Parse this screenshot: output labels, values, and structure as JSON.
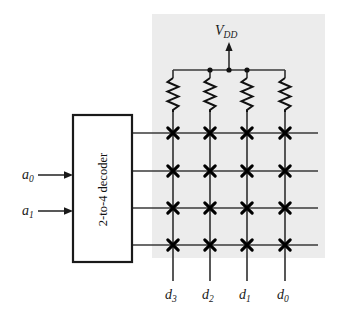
{
  "figure": {
    "background_color": "#ffffff",
    "shaded_region_color": "#ececec",
    "line_color": "#3a3a3a",
    "marker_color": "#000000",
    "text_color": "#1a1a1a"
  },
  "decoder": {
    "label": "2-to-4 decoder",
    "box": {
      "x": 73,
      "y": 115,
      "width": 59,
      "height": 147
    },
    "inputs": [
      {
        "name": "a0",
        "base": "a",
        "subscript": "0",
        "y": 175
      },
      {
        "name": "a1",
        "base": "a",
        "subscript": "1",
        "y": 211
      }
    ],
    "output_count": 4
  },
  "power": {
    "label_base": "V",
    "label_subscript": "DD",
    "rail_y": 70,
    "arrow_x": 229,
    "junction_dots": [
      210,
      229,
      247
    ]
  },
  "array": {
    "columns": [
      {
        "name": "d3",
        "base": "d",
        "subscript": "3",
        "x": 173
      },
      {
        "name": "d2",
        "base": "d",
        "subscript": "2",
        "x": 210
      },
      {
        "name": "d1",
        "base": "d",
        "subscript": "1",
        "x": 247
      },
      {
        "name": "d0",
        "base": "d",
        "subscript": "0",
        "x": 285
      }
    ],
    "rows": [
      133,
      171,
      208,
      245
    ],
    "crosspoint_marker": "x-marker",
    "resistor_count": 4,
    "resistor_top_y": 78,
    "resistor_bottom_y": 112,
    "column_bottom_y": 281,
    "row_line_start_x": 132,
    "row_line_end_x": 318,
    "shaded": {
      "x": 152,
      "y": 14,
      "width": 173,
      "height": 244
    }
  },
  "labels": {
    "output_label_y": 296,
    "vdd_label_x": 229,
    "vdd_label_y": 33
  }
}
